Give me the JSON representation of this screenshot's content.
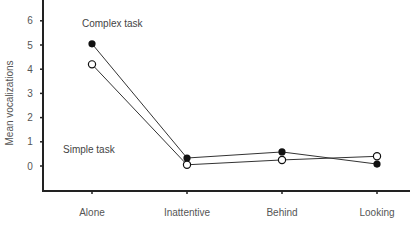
{
  "chart_data": {
    "type": "line",
    "title": "",
    "xlabel": "",
    "ylabel": "Mean vocalizations",
    "categories": [
      "Alone",
      "Inattentive",
      "Behind",
      "Looking"
    ],
    "series": [
      {
        "name": "Complex task",
        "marker": "filled-circle",
        "values": [
          5.05,
          0.33,
          0.58,
          0.08
        ]
      },
      {
        "name": "Simple task",
        "marker": "open-circle",
        "values": [
          4.2,
          0.05,
          0.25,
          0.4
        ]
      }
    ],
    "yticks": [
      0,
      1,
      2,
      3,
      4,
      5,
      6
    ],
    "ylim": [
      -1,
      6.6
    ],
    "grid": false,
    "annotations": [
      {
        "text": "Complex task",
        "near": "upper series"
      },
      {
        "text": "Simple task",
        "near": "lower series"
      }
    ]
  },
  "labels": {
    "ylabel": "Mean vocalizations",
    "complex": "Complex task",
    "simple": "Simple task"
  },
  "colors": {
    "axis": "#222222",
    "line": "#333333",
    "filled_marker": "#111111",
    "open_marker_fill": "#ffffff"
  }
}
